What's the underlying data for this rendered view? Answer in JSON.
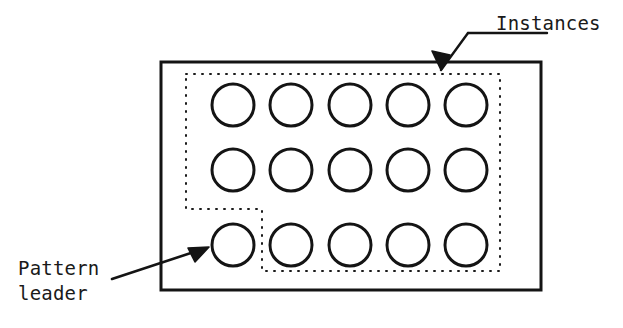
{
  "figure": {
    "background_color": "#ffffff",
    "stroke_color": "#141414",
    "dotted_color": "#1a1a1a",
    "annotations": {
      "instances": {
        "text": "Instances",
        "x": 496,
        "y": 11,
        "leader_line": {
          "x1": 547,
          "y1": 33,
          "x2": 468,
          "y2": 33
        },
        "arrow": {
          "x1": 468,
          "y1": 33,
          "x2": 441,
          "y2": 70
        }
      },
      "pattern_leader": {
        "text_line_1": "Pattern",
        "text_line_2": "leader",
        "x": 18,
        "y": 256,
        "arrow": {
          "x1": 112,
          "y1": 279,
          "x2": 206,
          "y2": 248
        }
      }
    },
    "outer_rectangle": {
      "name": "enclosing-frame",
      "x": 161,
      "y": 62,
      "width": 380,
      "height": 228,
      "stroke_width": 3
    },
    "dotted_region": {
      "name": "instance-region",
      "shape": "L-polygon",
      "points": "186,74 500,74 500,271 262,271 262,209 186,209",
      "stroke_width": 2,
      "dash": "1 7"
    },
    "circles": {
      "radius": 21,
      "stroke_width": 3,
      "rows": [
        {
          "cy": 105,
          "cx": [
            233,
            291,
            350,
            408,
            466
          ]
        },
        {
          "cy": 170,
          "cx": [
            233,
            291,
            350,
            408,
            466
          ]
        },
        {
          "cy": 245,
          "cx": [
            233,
            291,
            350,
            408,
            466
          ]
        }
      ],
      "leader_index": {
        "row": 2,
        "col": 0
      },
      "total_count": 15,
      "instance_count": 14
    }
  }
}
